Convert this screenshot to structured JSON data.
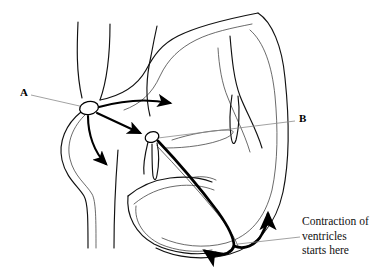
{
  "figure": {
    "background_color": "#ffffff",
    "line_color": "#111111",
    "accent_color": "#000000",
    "leader_color": "#8a8a8a",
    "width": 389,
    "height": 274
  },
  "labels": {
    "a": {
      "text": "A",
      "x": 20,
      "y": 90,
      "points_to": "sa-node"
    },
    "b": {
      "text": "B",
      "x": 299,
      "y": 115,
      "points_to": "av-node"
    }
  },
  "caption": {
    "lines": [
      "Contraction of",
      "ventricles",
      "starts here"
    ],
    "x": 302,
    "y": 214,
    "points_to": "ventricle-apex"
  },
  "nodes": [
    {
      "name": "sa-node",
      "label_ref": "A",
      "cx": 89,
      "cy": 108,
      "rx": 9.5,
      "ry": 6.5,
      "rotation": -12
    },
    {
      "name": "av-node",
      "label_ref": "B",
      "cx": 152,
      "cy": 137,
      "rx": 7.0,
      "ry": 5.2,
      "rotation": -20
    }
  ],
  "impulse_arrows": [
    {
      "name": "sa-to-right-atrium",
      "description": "curved arrow from SA node sweeping right across the atrium"
    },
    {
      "name": "sa-to-left-down",
      "description": "curved arrow from SA node sweeping down and left"
    },
    {
      "name": "sa-to-av",
      "description": "straight arrow from SA node down-right to AV node"
    },
    {
      "name": "av-to-apex",
      "description": "heavy line from AV node down through septum to apex"
    },
    {
      "name": "apex-up-right",
      "description": "arrow curving up the right free wall"
    },
    {
      "name": "apex-to-left",
      "description": "arrow curving left along the lower wall"
    }
  ],
  "icon_names": {
    "arrowhead": "arrowhead-icon",
    "node": "node-ellipse-icon",
    "leader": "leader-line-icon"
  }
}
